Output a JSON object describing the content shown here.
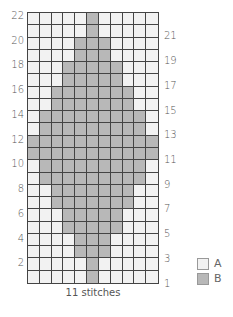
{
  "chart_data": {
    "type": "heatmap",
    "xlabel": "11 stitches",
    "columns": 11,
    "rows": 22,
    "row_labels_left": [
      "22",
      "20",
      "18",
      "16",
      "14",
      "12",
      "10",
      "8",
      "6",
      "4",
      "2"
    ],
    "row_labels_right": [
      "21",
      "19",
      "17",
      "15",
      "13",
      "11",
      "9",
      "7",
      "5",
      "3",
      "1"
    ],
    "legend": [
      {
        "key": "A",
        "color": "#f2f2f2"
      },
      {
        "key": "B",
        "color": "#b8b8b8"
      }
    ],
    "pattern_rows_bottom_to_top": [
      [
        6,
        6
      ],
      [
        6,
        6
      ],
      [
        5,
        7
      ],
      [
        5,
        7
      ],
      [
        4,
        8
      ],
      [
        4,
        8
      ],
      [
        3,
        9
      ],
      [
        3,
        9
      ],
      [
        2,
        10
      ],
      [
        2,
        10
      ],
      [
        1,
        11
      ],
      [
        1,
        11
      ],
      [
        2,
        10
      ],
      [
        2,
        10
      ],
      [
        3,
        9
      ],
      [
        3,
        9
      ],
      [
        4,
        8
      ],
      [
        4,
        8
      ],
      [
        5,
        7
      ],
      [
        5,
        7
      ],
      [
        6,
        6
      ],
      [
        6,
        6
      ]
    ]
  },
  "legend": {
    "a": "A",
    "b": "B"
  },
  "xlabel": "11 stitches",
  "colors": {
    "a": "#f2f2f2",
    "b": "#b8b8b8",
    "grid": "#444444"
  }
}
